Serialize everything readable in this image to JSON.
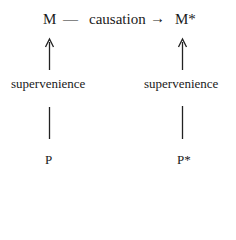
{
  "diagram": {
    "top_row": {
      "left_node": "M",
      "dash": "—",
      "relation": "causation",
      "arrow": "→",
      "right_node": "M*"
    },
    "left_column": {
      "relation_label": "supervenience",
      "base_node": "P"
    },
    "right_column": {
      "relation_label": "supervenience",
      "base_node": "P*"
    }
  }
}
